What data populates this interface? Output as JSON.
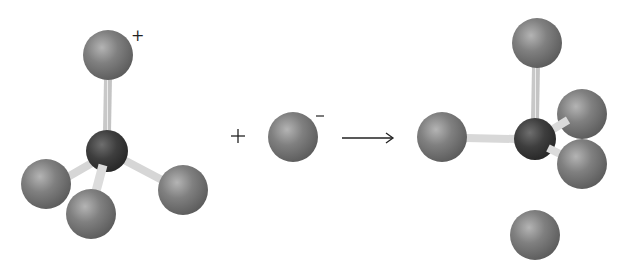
{
  "diagram": {
    "type": "molecular-reaction",
    "colors": {
      "background": "#ffffff",
      "outer_atom": "#7a7a7a",
      "outer_atom_highlight": "#b8b8b8",
      "central_atom": "#3c3c3c",
      "central_atom_highlight": "#7a7a7a",
      "bond": "#d6d6d6",
      "text": "#222222"
    },
    "reactant_cation": {
      "charge_label": "+",
      "central_atom": {
        "cx": 107,
        "cy": 151,
        "r": 21
      },
      "outer_atoms": [
        {
          "name": "top",
          "cx": 108,
          "cy": 55,
          "r": 25
        },
        {
          "name": "left",
          "cx": 46,
          "cy": 184,
          "r": 25
        },
        {
          "name": "front-bottom",
          "cx": 91,
          "cy": 214,
          "r": 25
        },
        {
          "name": "right",
          "cx": 183,
          "cy": 190,
          "r": 25
        }
      ],
      "charge_position": {
        "x": 136,
        "y": 40
      }
    },
    "plus_operator": {
      "label": "+",
      "x": 238,
      "y": 142
    },
    "reactant_anion": {
      "charge_label": "−",
      "atom": {
        "cx": 293,
        "cy": 137,
        "r": 25
      },
      "charge_position": {
        "x": 320,
        "y": 121
      }
    },
    "arrow": {
      "label": "→",
      "x1": 342,
      "x2": 393,
      "y": 138
    },
    "product": {
      "central_atom": {
        "cx": 535,
        "cy": 139,
        "r": 21
      },
      "outer_atoms": [
        {
          "name": "top-axial",
          "cx": 537,
          "cy": 43,
          "r": 25
        },
        {
          "name": "left-equatorial",
          "cx": 442,
          "cy": 137,
          "r": 25
        },
        {
          "name": "back-right-equatorial",
          "cx": 582,
          "cy": 114,
          "r": 25
        },
        {
          "name": "front-right-equatorial",
          "cx": 582,
          "cy": 164,
          "r": 25
        },
        {
          "name": "bottom-axial",
          "cx": 535,
          "cy": 235,
          "r": 25
        }
      ]
    }
  }
}
